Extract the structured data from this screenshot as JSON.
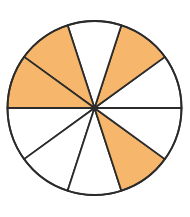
{
  "diagram": {
    "type": "fraction-circle",
    "total_parts": 10,
    "shaded_parts": 4,
    "fraction_label": "4/10",
    "center": [
      94.5,
      108
    ],
    "radius": 87,
    "start_angle_deg": 0,
    "shaded_sector_indices": [
      1,
      3,
      4,
      8
    ],
    "colors": {
      "shaded": "#F6B66C",
      "unshaded": "#FFFFFF",
      "stroke": "#2B2B2B",
      "background": "#FFFFFF"
    },
    "stroke_width": 1.8
  }
}
